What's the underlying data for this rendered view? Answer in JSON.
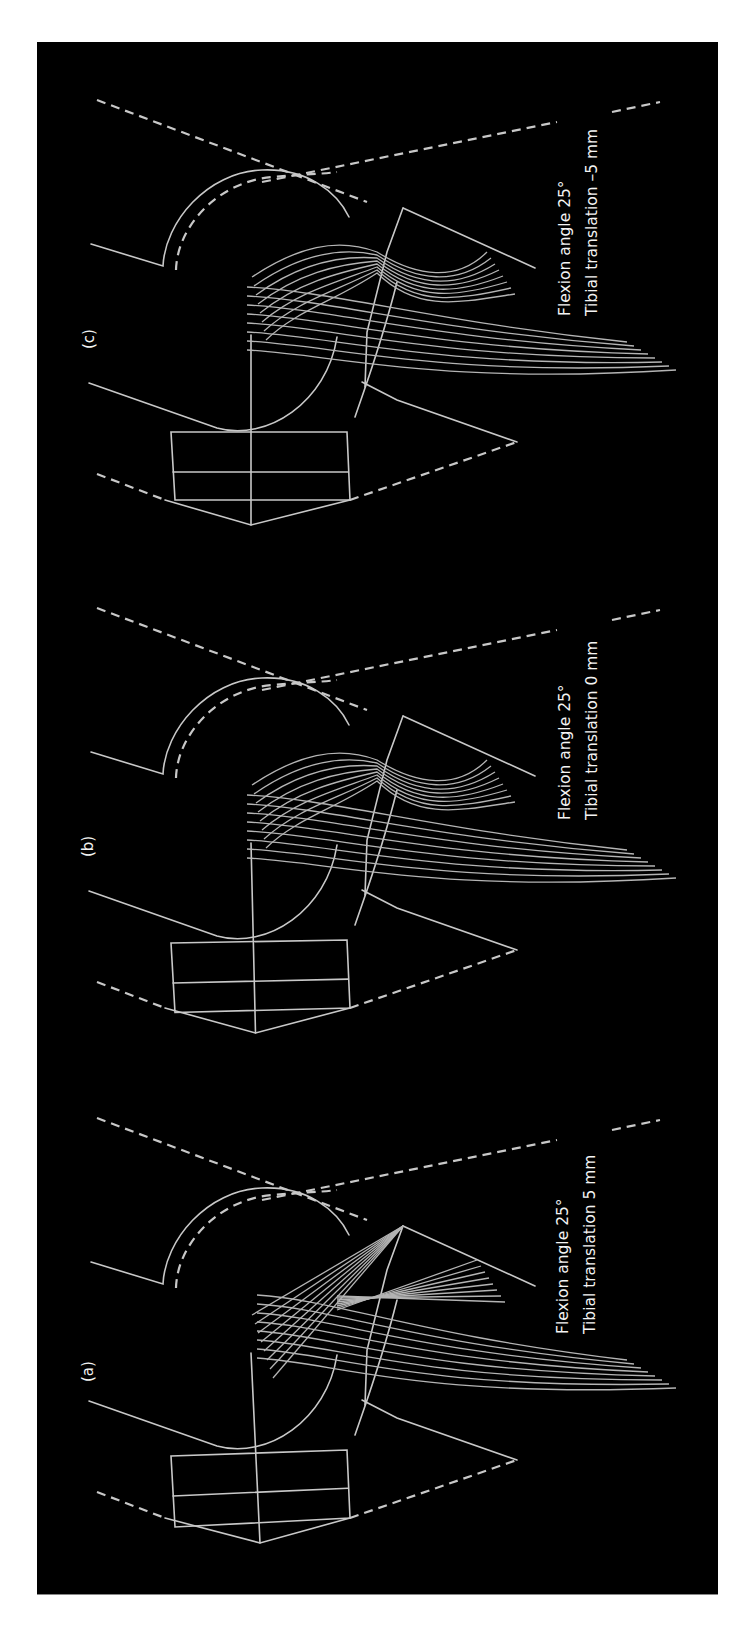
{
  "figure": {
    "background": "#000000",
    "line_color": "#c8c8c8",
    "fiber_color": "#b4b4b4",
    "text_color": "#f4f4f4",
    "orientation": "rotated -90deg (text reads bottom-to-top)"
  },
  "panels": [
    {
      "id": "a",
      "label": "(a)",
      "flexion_label": "Flexion angle 25°",
      "translation_label": "Tibial translation 5 mm",
      "flexion_angle_deg": 25,
      "tibial_translation_mm": 5,
      "offset_y": 1018
    },
    {
      "id": "b",
      "label": "(b)",
      "flexion_label": "Flexion angle 25°",
      "translation_label": "Tibial translation 0 mm",
      "flexion_angle_deg": 25,
      "tibial_translation_mm": 0,
      "offset_y": 508
    },
    {
      "id": "c",
      "label": "(c)",
      "flexion_label": "Flexion angle 25°",
      "translation_label": "Tibial translation –5 mm",
      "flexion_angle_deg": 25,
      "tibial_translation_mm": -5,
      "offset_y": 0
    }
  ]
}
